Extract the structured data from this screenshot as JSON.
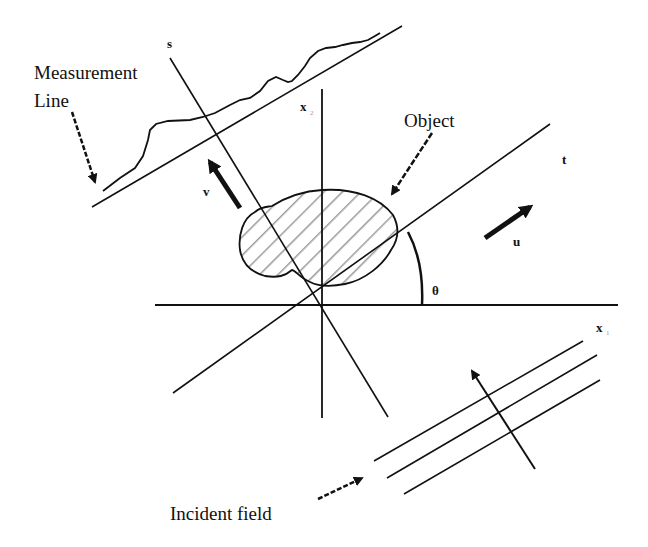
{
  "diagram": {
    "labels": {
      "measurement_line": [
        "Measurement",
        "Line"
      ],
      "object": "Object",
      "incident_field": "Incident field",
      "s_axis": "s",
      "t_axis": "t",
      "x1_axis": "x",
      "x1_sub": "1",
      "x2_axis": "x",
      "x2_sub": "2",
      "v_vector": "v",
      "u_vector": "u",
      "angle": "θ"
    },
    "colors": {
      "ink": "#111111",
      "hatch": "#9a9a9a",
      "background": "#ffffff"
    }
  }
}
